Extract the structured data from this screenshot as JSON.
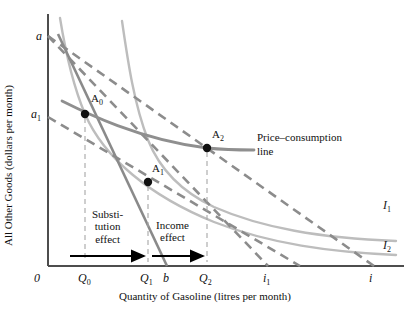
{
  "figure": {
    "axes": {
      "y_title": "All Other Goods (dollars per month)",
      "x_title": "Quantity of Gasoline (litres per month)"
    },
    "y_ticks": [
      {
        "id": "a",
        "label": "a",
        "sub": "",
        "x": 36,
        "y": 38
      },
      {
        "id": "a1",
        "label": "a",
        "sub": "1",
        "x": 32,
        "y": 116
      }
    ],
    "x_ticks": [
      {
        "id": "zero",
        "label": "0",
        "sub": "",
        "x": 34,
        "y": 280
      },
      {
        "id": "Q0",
        "label": "Q",
        "sub": "0",
        "x": 79,
        "y": 280
      },
      {
        "id": "Q1",
        "label": "Q",
        "sub": "1",
        "x": 141,
        "y": 280
      },
      {
        "id": "b",
        "label": "b",
        "sub": "",
        "x": 166,
        "y": 280
      },
      {
        "id": "Q2",
        "label": "Q",
        "sub": "2",
        "x": 200,
        "y": 280
      },
      {
        "id": "i1",
        "label": "i",
        "sub": "1",
        "x": 263,
        "y": 280
      },
      {
        "id": "i",
        "label": "i",
        "sub": "",
        "x": 369,
        "y": 280
      }
    ],
    "points": [
      {
        "id": "A0",
        "label": "A",
        "sub": "0",
        "cx": 85,
        "cy": 114,
        "lx": 91,
        "ly": 92
      },
      {
        "id": "A1",
        "label": "A",
        "sub": "1",
        "cx": 148,
        "cy": 182,
        "lx": 152,
        "ly": 162
      },
      {
        "id": "A2",
        "label": "A",
        "sub": "2",
        "cx": 207,
        "cy": 148,
        "lx": 212,
        "ly": 128
      }
    ],
    "curve_labels": [
      {
        "id": "I1",
        "label": "I",
        "sub": "1",
        "x": 383,
        "y": 201
      },
      {
        "id": "I2",
        "label": "I",
        "sub": "2",
        "x": 383,
        "y": 241
      }
    ],
    "annotations": {
      "price_consumption": {
        "line1": "Price–consumption",
        "line2": "line",
        "x": 257,
        "y": 131
      },
      "substitution": {
        "lines": [
          "Substi-",
          "tution",
          "effect"
        ],
        "x": 92,
        "y": 211
      },
      "income": {
        "lines": [
          "Income",
          "effect"
        ],
        "x": 166,
        "y": 219
      }
    },
    "colors": {
      "axis": "#4d4d4d",
      "budget_dashed": "#8c8c8c",
      "indifference": "#b5b5b5",
      "price_consumption_line": "#8f8f8f",
      "steep_line": "#7a7a7a",
      "point": "#111111",
      "arrow": "#000000",
      "guide_dashed": "#9a9a9a"
    }
  }
}
